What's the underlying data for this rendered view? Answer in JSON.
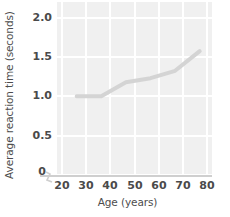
{
  "chart_data": {
    "type": "line",
    "title": "",
    "xlabel": "Age (years)",
    "ylabel": "Average reaction time (seconds)",
    "xlim": [
      17,
      80
    ],
    "ylim": [
      0,
      2.1
    ],
    "xticks": [
      20,
      30,
      40,
      50,
      60,
      70,
      80
    ],
    "xtick_labels": [
      "20",
      "30",
      "40",
      "50",
      "60",
      "70",
      "80"
    ],
    "yticks": [
      0,
      0.5,
      1.0,
      1.5,
      2.0
    ],
    "ytick_labels": [
      "0",
      "0.5",
      "1.0",
      "1.5",
      "2.0"
    ],
    "grid": true,
    "grid_color": "#ffffff",
    "panel_color": "#f0f0f0",
    "legend": "none",
    "axis_break": true,
    "axis_break_note": "zigzag break on x-axis between 0 and 20",
    "series": [
      {
        "name": "Average reaction time",
        "color": "#d4d4d4",
        "line_width": 4,
        "x": [
          25,
          35,
          45,
          55,
          65,
          75
        ],
        "values": [
          0.95,
          0.95,
          1.12,
          1.17,
          1.26,
          1.5
        ]
      }
    ]
  },
  "axes": {
    "y_title": "Average reaction time (seconds)",
    "x_title": "Age (years)"
  },
  "colors": {
    "panel": "#f0f0f0",
    "grid": "#ffffff",
    "line": "#d4d4d4",
    "axis": "#cfcfcf",
    "tick_text": "#4a4a4a",
    "title_text": "#4d4d4d"
  }
}
